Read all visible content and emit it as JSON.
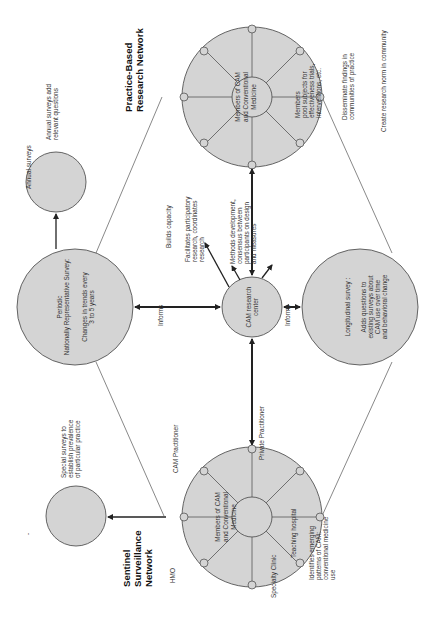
{
  "diagram": {
    "orientation": "rotated-90-ccw",
    "networks": {
      "pbrn": {
        "title_line1": "Practice-Based",
        "title_line2": "Research Network",
        "center_line1": "Members of CAM",
        "center_line2": "and Conventional",
        "center_line3": "Medicine",
        "notes": {
          "members_line1": "Members",
          "members_line2": "pool subjects for",
          "members_line3": "effectiveness trials,",
          "members_line4": "interventions, etc.",
          "disseminate_line1": "Disseminate findings in",
          "disseminate_line2": "communities of practice",
          "research_norm": "Create research norm in community"
        }
      },
      "sentinel": {
        "title_line1": "Sentinel",
        "title_line2": "Surveillance",
        "title_line3": "Network",
        "center_line1": "Members of CAM",
        "center_line2": "and Conventional",
        "center_line3": "Medicine",
        "nodes": {
          "hmo": "HMO",
          "cam_practitioner": "CAM Practitioner",
          "private_practitioner": "Private Practitioner",
          "teaching_hospital": "Teaching hospital",
          "specialty_clinic": "Specialty Clinic"
        },
        "notes": {
          "identifies_line1": "Identifies emerging",
          "identifies_line2": "patterns of CAM:",
          "identifies_line3": "conventional medicine",
          "identifies_line4": "use"
        }
      }
    },
    "surveys": {
      "periodic": {
        "line1": "Periodic",
        "line2": "Nationally Representative Survey:",
        "line3": "Changes in trends every",
        "line4": "3 to 5 years"
      },
      "annual": {
        "line1": "Annual surveys",
        "note_line1": "Annual surveys add",
        "note_line2": "relevant questions"
      },
      "longitudinal": {
        "line1": "Longitudinal survey :",
        "line2": "Adds questions to",
        "line3": "existing surveys about",
        "line4": "CAM  use over time",
        "line5": "and behavioral change"
      },
      "special": {
        "note_line1": "Special surveys to",
        "note_line2": "establish prevalence",
        "note_line3": "of particular  practice"
      }
    },
    "center": {
      "line1": "CAM research",
      "line2": "center",
      "informs_left": "Informs",
      "informs_right": "Informs",
      "builds_capacity": "Builds capacity",
      "facilitates_line1": "Facilitates participatory",
      "facilitates_line2": "research, coordinates",
      "facilitates_line3": "research",
      "methods_line1": "Methods development,",
      "methods_line2": "consensus between",
      "methods_line3": "participants on design",
      "methods_line4": "and measures"
    },
    "stray_mark": "-"
  },
  "colors": {
    "circle_fill": "#d4d4d4",
    "stroke": "#555555",
    "arrow": "#222222",
    "text": "#333333"
  }
}
